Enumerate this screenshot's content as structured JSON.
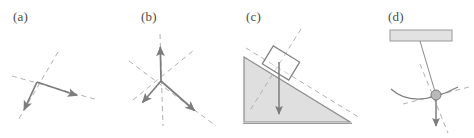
{
  "figure": {
    "background_color": "#ffffff",
    "width": 474,
    "height": 138,
    "stroke_color": "#7d7d7d",
    "dash_color": "#b0b0b0",
    "fill_color": "#dcdcdc",
    "fill_edge_color": "#6f6f6f"
  },
  "panels": [
    {
      "id": "a",
      "label": "(a)",
      "caption_x": 13,
      "caption_y": 10,
      "kind": "two-vector-junction",
      "description": "Two solid arrows meeting at a vertex, each lying along its own dashed construction line",
      "vertex": {
        "x": 37,
        "y": 82
      },
      "vectors": [
        {
          "name": "down-left-arrow",
          "to_x": 24,
          "to_y": 111
        },
        {
          "name": "right-arrow",
          "to_x": 78,
          "to_y": 96
        }
      ],
      "dashed_lines": [
        {
          "name": "dashed-line-steep",
          "x1": 58,
          "y1": 52,
          "x2": 17,
          "y2": 122
        },
        {
          "name": "dashed-line-shallow",
          "x1": 12,
          "y1": 76,
          "x2": 98,
          "y2": 100
        }
      ]
    },
    {
      "id": "b",
      "label": "(b)",
      "caption_x": 141,
      "caption_y": 10,
      "kind": "three-vector-junction",
      "description": "Three solid arrows radiating from a common vertex with dashed construction lines through each",
      "vertex": {
        "x": 161,
        "y": 81
      },
      "vectors": [
        {
          "name": "up-arrow",
          "to_x": 160,
          "to_y": 45
        },
        {
          "name": "down-left-arrow",
          "to_x": 141,
          "to_y": 104
        },
        {
          "name": "down-right-arrow",
          "to_x": 196,
          "to_y": 112
        }
      ],
      "dashed_lines": [
        {
          "name": "dashed-line-vertical",
          "x1": 160,
          "y1": 34,
          "x2": 163,
          "y2": 126
        },
        {
          "name": "dashed-line-diagonal-up-right",
          "x1": 133,
          "y1": 100,
          "x2": 194,
          "y2": 50
        },
        {
          "name": "dashed-line-diagonal-down-right",
          "x1": 128,
          "y1": 61,
          "x2": 216,
          "y2": 126
        }
      ]
    },
    {
      "id": "c",
      "label": "(c)",
      "caption_x": 246,
      "caption_y": 10,
      "kind": "block-on-incline",
      "description": "Shaded right-triangle ramp with a tilted block resting on the slope and a vertical weight arrow",
      "incline": {
        "name": "incline-wedge",
        "apex_x": 244,
        "apex_y": 57,
        "foot_x": 350,
        "foot_y": 122,
        "base_left_x": 244,
        "base_y": 122
      },
      "block": {
        "name": "block-on-incline",
        "center_x": 281,
        "center_y": 63,
        "width": 31,
        "height": 21,
        "rotation_deg": 31
      },
      "weight_arrow": {
        "name": "weight-arrow",
        "x1": 279,
        "y1": 63,
        "x2": 279,
        "y2": 116
      },
      "dashed_lines": [
        {
          "name": "dashed-line-parallel-to-incline",
          "x1": 246,
          "y1": 49,
          "x2": 358,
          "y2": 115
        },
        {
          "name": "dashed-line-normal-to-incline",
          "x1": 300,
          "y1": 30,
          "x2": 250,
          "y2": 110
        }
      ]
    },
    {
      "id": "d",
      "label": "(d)",
      "caption_x": 388,
      "caption_y": 10,
      "kind": "pendulum",
      "description": "Pendulum hung from a hatched ceiling bar, bob swinging on an arc with a downward arrow",
      "ceiling": {
        "name": "ceiling-bar",
        "x": 390,
        "y": 30,
        "width": 62,
        "height": 11
      },
      "pivot": {
        "x": 420,
        "y": 41
      },
      "bob": {
        "name": "pendulum-bob",
        "x": 436,
        "y": 96,
        "r": 5
      },
      "string": {
        "name": "pendulum-string",
        "x1": 420,
        "y1": 41,
        "x2": 436,
        "y2": 96
      },
      "arc": {
        "name": "swing-arc",
        "x1": 392,
        "y1": 90,
        "cx": 412,
        "cy": 107,
        "x2": 456,
        "y2": 88
      },
      "weight_arrow": {
        "name": "weight-arrow",
        "x1": 436,
        "y1": 96,
        "x2": 436,
        "y2": 128
      },
      "dashed_lines": [
        {
          "name": "dashed-line-tangent",
          "x1": 404,
          "y1": 104,
          "x2": 468,
          "y2": 88
        },
        {
          "name": "dashed-line-radial",
          "x1": 420,
          "y1": 66,
          "x2": 447,
          "y2": 132
        }
      ]
    }
  ]
}
